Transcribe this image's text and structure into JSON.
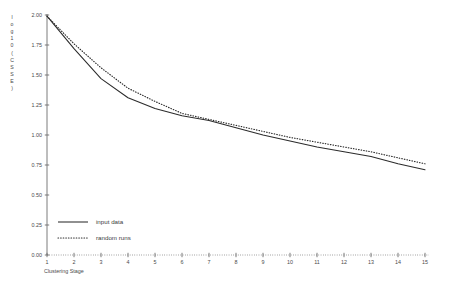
{
  "chart_data": {
    "type": "line",
    "title": "",
    "xlabel": "Clustering Stage",
    "ylabel": "log10(CSSE)",
    "xlim": [
      1,
      15
    ],
    "ylim": [
      0.0,
      2.0
    ],
    "grid": false,
    "legend_position": "bottom-left",
    "x": [
      1,
      2,
      3,
      4,
      5,
      6,
      7,
      8,
      9,
      10,
      11,
      12,
      13,
      14,
      15
    ],
    "xtick_labels": [
      "1",
      "2",
      "3",
      "4",
      "5",
      "6",
      "7",
      "8",
      "9",
      "10",
      "11",
      "12",
      "13",
      "14",
      "15"
    ],
    "ytick_labels": [
      "0.00",
      "0.25",
      "0.50",
      "0.75",
      "1.00",
      "1.25",
      "1.50",
      "1.75",
      "2.00"
    ],
    "ytick_values": [
      0.0,
      0.25,
      0.5,
      0.75,
      1.0,
      1.25,
      1.5,
      1.75,
      2.0
    ],
    "series": [
      {
        "name": "input data",
        "style": "solid",
        "color": "#2b2b2b",
        "values": [
          1.99,
          1.72,
          1.47,
          1.31,
          1.22,
          1.16,
          1.12,
          1.06,
          1.0,
          0.95,
          0.9,
          0.86,
          0.82,
          0.76,
          0.71
        ]
      },
      {
        "name": "random runs",
        "style": "dotted",
        "color": "#2b2b2b",
        "values": [
          1.99,
          1.76,
          1.56,
          1.39,
          1.28,
          1.18,
          1.13,
          1.08,
          1.03,
          0.98,
          0.94,
          0.9,
          0.86,
          0.81,
          0.76
        ]
      }
    ]
  },
  "legend": {
    "items": [
      {
        "label": "input data",
        "style": "solid"
      },
      {
        "label": "random runs",
        "style": "dotted"
      }
    ]
  },
  "axes": {
    "y_axis_label": "log10(CSSE)",
    "x_axis_label": "Clustering Stage"
  }
}
